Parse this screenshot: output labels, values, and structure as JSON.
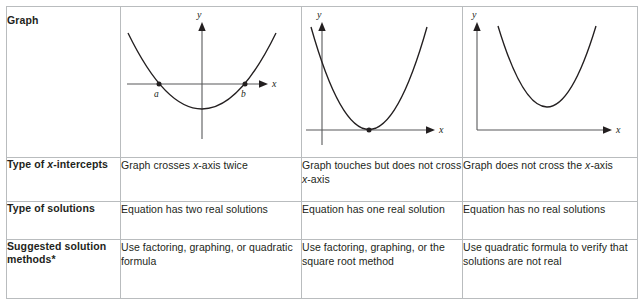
{
  "table": {
    "rows": [
      {
        "label": "Graph",
        "label_name": "row-label-graph",
        "cells": [
          "",
          "",
          ""
        ]
      },
      {
        "label_prefix": "Type of ",
        "label_italic": "x",
        "label_suffix": "-intercepts",
        "label_plain": "Type of x-intercepts",
        "cells": [
          {
            "pre": "Graph crosses ",
            "ital": "x",
            "post": "-axis twice",
            "plain": "Graph crosses x-axis twice"
          },
          {
            "pre": "Graph touches but does not cross ",
            "ital": "x",
            "post": "-axis",
            "plain": "Graph touches but does not cross x-axis"
          },
          {
            "pre": "Graph does not cross the ",
            "ital": "x",
            "post": "-axis",
            "plain": "Graph does not cross the x-axis"
          }
        ]
      },
      {
        "label_plain": "Type of solutions",
        "cells": [
          {
            "plain": "Equation has two real solutions"
          },
          {
            "plain": "Equation has one real solution"
          },
          {
            "plain": "Equation has no real solutions"
          }
        ]
      },
      {
        "label_plain": "Suggested solution methods*",
        "cells": [
          {
            "plain": "Use factoring, graphing, or quadratic formula"
          },
          {
            "plain": "Use factoring, graphing, or the square root method"
          },
          {
            "plain": "Use quadratic formula to verify that solutions are not real"
          }
        ]
      }
    ]
  },
  "graphs": [
    {
      "name": "parabola-two-roots",
      "axis_x_label": "x",
      "axis_y_label": "y",
      "point_labels": [
        "a",
        "b"
      ],
      "description": "Upward parabola crossing the x-axis at two points a and b"
    },
    {
      "name": "parabola-one-root",
      "axis_x_label": "x",
      "axis_y_label": "y",
      "point_labels": [],
      "description": "Upward parabola touching the x-axis at its vertex"
    },
    {
      "name": "parabola-no-roots",
      "axis_x_label": "x",
      "axis_y_label": "y",
      "point_labels": [],
      "description": "Upward parabola entirely above the x-axis"
    }
  ],
  "colors": {
    "border": "#b9bcbe",
    "text": "#231f20",
    "axis": "#58595b",
    "curve": "#231f20",
    "background": "#ffffff"
  }
}
